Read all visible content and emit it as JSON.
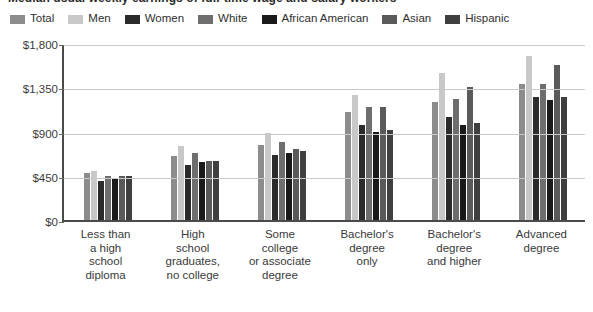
{
  "chart_data": {
    "type": "bar",
    "title": "Median usual weekly earnings of full-time wage and salary workers",
    "subtitle": "",
    "xlabel": "",
    "ylabel": "",
    "ylim": [
      0,
      1800
    ],
    "ytick_values": [
      0,
      450,
      900,
      1350,
      1800
    ],
    "ytick_labels": [
      "$0",
      "$450",
      "$900",
      "$1,350",
      "$1,800"
    ],
    "grid": true,
    "legend_position": "top",
    "categories": [
      "Less than a high school diploma",
      "High school graduates, no college",
      "Some college or associate degree",
      "Bachelor's degree only",
      "Bachelor's degree and higher",
      "Advanced degree"
    ],
    "category_label_lines": [
      [
        "Less than",
        "a high",
        "school",
        "diploma"
      ],
      [
        "High",
        "school",
        "graduates,",
        "no college"
      ],
      [
        "Some",
        "college",
        "or associate",
        "degree"
      ],
      [
        "Bachelor's",
        "degree",
        "only"
      ],
      [
        "Bachelor's",
        "degree",
        "and higher"
      ],
      [
        "Advanced",
        "degree"
      ]
    ],
    "series": [
      {
        "name": "Total",
        "color": "#8c8c8c",
        "values": [
          480,
          650,
          760,
          1100,
          1200,
          1380
        ]
      },
      {
        "name": "Men",
        "color": "#c8c8c8",
        "values": [
          500,
          750,
          880,
          1270,
          1500,
          1670
        ]
      },
      {
        "name": "Women",
        "color": "#2b2b2b",
        "values": [
          400,
          560,
          660,
          970,
          1050,
          1250
        ]
      },
      {
        "name": "White",
        "color": "#6e6e6e",
        "values": [
          450,
          680,
          790,
          1150,
          1230,
          1380
        ]
      },
      {
        "name": "African American",
        "color": "#1a1a1a",
        "values": [
          420,
          590,
          680,
          900,
          970,
          1220
        ]
      },
      {
        "name": "Asian",
        "color": "#5a5a5a",
        "values": [
          450,
          600,
          720,
          1150,
          1350,
          1580
        ]
      },
      {
        "name": "Hispanic",
        "color": "#3f3f3f",
        "values": [
          450,
          600,
          700,
          920,
          990,
          1250
        ]
      }
    ]
  }
}
